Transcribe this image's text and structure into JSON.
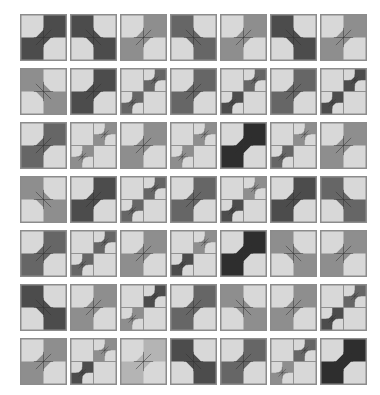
{
  "layout": {
    "origin_x": 20,
    "origin_y": 14,
    "pitch_x": 50,
    "pitch_y": 54,
    "tile_size": 47
  },
  "colors": {
    "background": "#ffffff",
    "light": "#d8d8d8",
    "border": "#8c8c8c",
    "line": "#303030",
    "shades": {
      "lm": "#b4b4b4",
      "m": "#8e8e8e",
      "dm": "#666666",
      "d": "#4c4c4c",
      "vd": "#2e2e2e"
    }
  },
  "tiles": [
    [
      {
        "t": "A",
        "c": "d"
      },
      {
        "t": "B",
        "c": "d"
      },
      {
        "t": "A",
        "c": "m"
      },
      {
        "t": "B",
        "c": "dm"
      },
      {
        "t": "A",
        "c": "m"
      },
      {
        "t": "B",
        "c": "d"
      },
      {
        "t": "A",
        "c": "m"
      }
    ],
    [
      {
        "t": "B",
        "c": "m"
      },
      {
        "t": "A",
        "c": "d"
      },
      {
        "t": "C",
        "tr": "dm",
        "bl": "dm"
      },
      {
        "t": "A",
        "c": "dm"
      },
      {
        "t": "C",
        "tr": "dm",
        "bl": "d"
      },
      {
        "t": "A",
        "c": "dm"
      },
      {
        "t": "C",
        "tr": "d",
        "bl": "d"
      }
    ],
    [
      {
        "t": "A",
        "c": "dm"
      },
      {
        "t": "C",
        "tr": "m",
        "bl": "m"
      },
      {
        "t": "A",
        "c": "m"
      },
      {
        "t": "C",
        "tr": "m",
        "bl": "m"
      },
      {
        "t": "A",
        "c": "vd"
      },
      {
        "t": "C",
        "tr": "m",
        "bl": "dm"
      },
      {
        "t": "A",
        "c": "m"
      }
    ],
    [
      {
        "t": "B",
        "c": "m"
      },
      {
        "t": "A",
        "c": "d"
      },
      {
        "t": "C",
        "tr": "dm",
        "bl": "dm"
      },
      {
        "t": "A",
        "c": "dm"
      },
      {
        "t": "C",
        "tr": "m",
        "bl": "d"
      },
      {
        "t": "A",
        "c": "d"
      },
      {
        "t": "B",
        "c": "dm"
      }
    ],
    [
      {
        "t": "A",
        "c": "dm"
      },
      {
        "t": "C",
        "tr": "dm",
        "bl": "dm"
      },
      {
        "t": "A",
        "c": "m"
      },
      {
        "t": "C",
        "tr": "m",
        "bl": "d"
      },
      {
        "t": "A",
        "c": "vd"
      },
      {
        "t": "B",
        "c": "m"
      },
      {
        "t": "A",
        "c": "m"
      }
    ],
    [
      {
        "t": "B",
        "c": "d"
      },
      {
        "t": "A",
        "c": "m"
      },
      {
        "t": "C",
        "tr": "d",
        "bl": "m"
      },
      {
        "t": "A",
        "c": "dm"
      },
      {
        "t": "B",
        "c": "m"
      },
      {
        "t": "A",
        "c": "m"
      },
      {
        "t": "C",
        "tr": "dm",
        "bl": "d"
      }
    ],
    [
      {
        "t": "A",
        "c": "m"
      },
      {
        "t": "C",
        "tr": "m",
        "bl": "d"
      },
      {
        "t": "A",
        "c": "lm"
      },
      {
        "t": "B",
        "c": "d"
      },
      {
        "t": "A",
        "c": "dm"
      },
      {
        "t": "C",
        "tr": "dm",
        "bl": "m"
      },
      {
        "t": "A",
        "c": "vd"
      }
    ]
  ]
}
